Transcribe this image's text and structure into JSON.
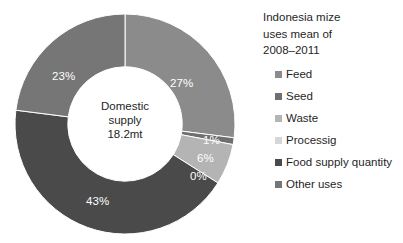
{
  "chart_data": {
    "type": "pie",
    "variant": "donut",
    "title": "Indonesia mize uses mean of 2008–2011",
    "title_lines": [
      "Indonesia mize",
      "uses mean of",
      "2008–2011"
    ],
    "categories": [
      "Feed",
      "Seed",
      "Waste",
      "Processig",
      "Food supply quantity",
      "Other uses"
    ],
    "values": [
      27,
      1,
      6,
      0,
      43,
      23
    ],
    "value_labels": [
      "27%",
      "1%",
      "6%",
      "0%",
      "43%",
      "23%"
    ],
    "colors": [
      "#8b8b8b",
      "#6f6f6f",
      "#b4b4b4",
      "#d6d6d6",
      "#4a4a4a",
      "#767676"
    ],
    "units": "percent",
    "start_angle_deg": 0,
    "direction": "clockwise",
    "inner_radius_ratio": 0.52,
    "legend_position": "right",
    "grid": false,
    "xlabel": "",
    "ylabel": "",
    "center_label": {
      "lines": [
        "Domestic",
        "supply",
        "18.2mt"
      ],
      "text": "Domestic supply 18.2mt",
      "total_value": "18.2mt",
      "caption": "Domestic supply"
    },
    "slice_label_positions": [
      {
        "label": "27%",
        "x": 170,
        "y": 78
      },
      {
        "label": "1%",
        "x": 203,
        "y": 135
      },
      {
        "label": "6%",
        "x": 197,
        "y": 153
      },
      {
        "label": "0%",
        "x": 190,
        "y": 171
      },
      {
        "label": "43%",
        "x": 86,
        "y": 196
      },
      {
        "label": "23%",
        "x": 52,
        "y": 71
      }
    ]
  },
  "legend": {
    "items": [
      {
        "label": "Feed",
        "color": "#8b8b8b"
      },
      {
        "label": "Seed",
        "color": "#6f6f6f"
      },
      {
        "label": "Waste",
        "color": "#b4b4b4"
      },
      {
        "label": "Processig",
        "color": "#d6d6d6"
      },
      {
        "label": "Food supply quantity",
        "color": "#4a4a4a"
      },
      {
        "label": "Other uses",
        "color": "#767676"
      }
    ]
  },
  "colors": {
    "background": "#ffffff",
    "text": "#1f1f1f",
    "slice_label": "#ffffff"
  }
}
